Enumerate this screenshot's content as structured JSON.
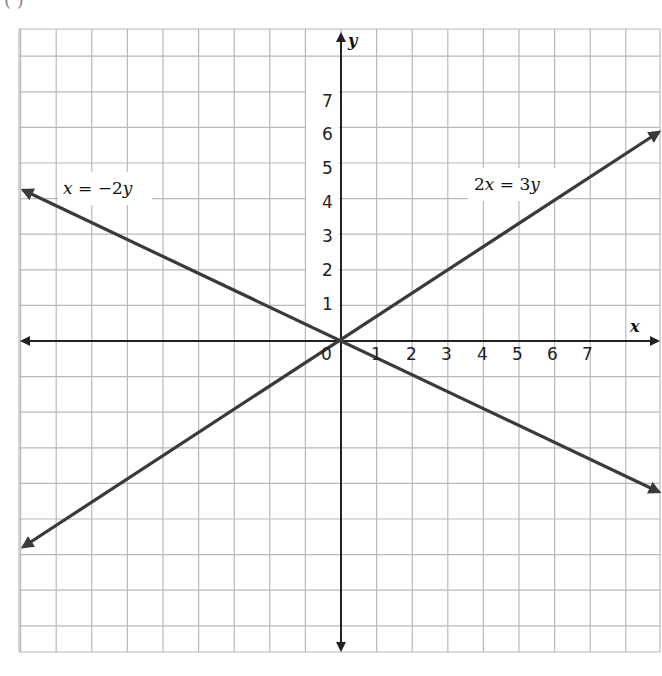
{
  "figure": {
    "partial_label": "( )"
  },
  "chart_data": {
    "type": "line",
    "title": "",
    "xlabel": "x",
    "ylabel": "y",
    "xlim": [
      -9,
      9
    ],
    "ylim": [
      -9,
      8.8
    ],
    "grid": true,
    "x_ticks": [
      "0",
      "1",
      "2",
      "3",
      "4",
      "5",
      "6",
      "7"
    ],
    "y_ticks": [
      "1",
      "2",
      "3",
      "4",
      "5",
      "6",
      "7"
    ],
    "series": [
      {
        "name": "x = −2y",
        "equation": "x = -2y",
        "points": [
          [
            -9,
            4.5
          ],
          [
            0,
            0
          ],
          [
            9,
            -4.5
          ]
        ]
      },
      {
        "name": "2x = 3y",
        "equation": "2x = 3y",
        "points": [
          [
            -9,
            -6
          ],
          [
            0,
            0
          ],
          [
            9,
            6
          ]
        ]
      }
    ],
    "annotations": [
      {
        "text": "x = −2y",
        "at": [
          -7.5,
          4.5
        ]
      },
      {
        "text": "2x = 3y",
        "at": [
          3.8,
          4.5
        ]
      }
    ],
    "colors": {
      "grid": "#b9b9b9",
      "axes": "#222222",
      "lines": "#3a3a3a"
    }
  },
  "labels": {
    "x_axis": "x",
    "y_axis": "y",
    "line1": {
      "lhs": "x",
      "eq": " = −2",
      "rhs": "y"
    },
    "line2": {
      "pre": "2",
      "lhs": "x",
      "eq": " = 3",
      "rhs": "y"
    },
    "origin": "0",
    "xticks": {
      "t1": "1",
      "t2": "2",
      "t3": "3",
      "t4": "4",
      "t5": "5",
      "t6": "6",
      "t7": "7"
    },
    "yticks": {
      "t1": "1",
      "t2": "2",
      "t3": "3",
      "t4": "4",
      "t5": "5",
      "t6": "6",
      "t7": "7"
    }
  }
}
